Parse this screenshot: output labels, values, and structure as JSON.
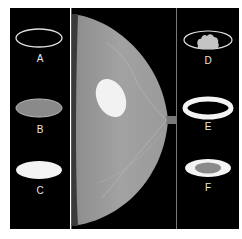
{
  "figure": {
    "left_column": {
      "items": [
        {
          "label": "A",
          "description": "ellipse outline only"
        },
        {
          "label": "B",
          "description": "gray filled ellipse"
        },
        {
          "label": "C",
          "description": "white filled ellipse"
        }
      ]
    },
    "center": {
      "description": "mammogram of breast with bright oval lesion",
      "colors": {
        "tissue": "#9a9a9a",
        "lesion": "#f2f2f2",
        "background": "#000000"
      }
    },
    "right_column": {
      "items": [
        {
          "label": "D",
          "description": "ellipse outline with lobulated gray mass"
        },
        {
          "label": "E",
          "description": "white ring ellipse with dark center"
        },
        {
          "label": "F",
          "description": "white ring ellipse with gray center"
        }
      ]
    }
  }
}
